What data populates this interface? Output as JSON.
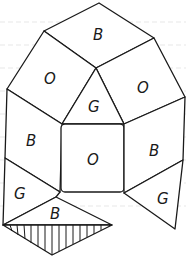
{
  "diagram": {
    "type": "polyhedron-net-coloring",
    "stroke_color": "#1a1a1a",
    "faces": [
      {
        "id": "top",
        "label": "B",
        "x": 99,
        "y": 34
      },
      {
        "id": "upper-left",
        "label": "O",
        "x": 50,
        "y": 78
      },
      {
        "id": "upper-right",
        "label": "O",
        "x": 143,
        "y": 87
      },
      {
        "id": "center-triangle",
        "label": "G",
        "x": 94,
        "y": 106
      },
      {
        "id": "left",
        "label": "B",
        "x": 32,
        "y": 140
      },
      {
        "id": "center-square",
        "label": "O",
        "x": 93,
        "y": 159
      },
      {
        "id": "right",
        "label": "B",
        "x": 155,
        "y": 150
      },
      {
        "id": "lower-left",
        "label": "G",
        "x": 20,
        "y": 193
      },
      {
        "id": "bottom-triangle",
        "label": "B",
        "x": 56,
        "y": 213
      },
      {
        "id": "lower-right",
        "label": "G",
        "x": 163,
        "y": 198
      },
      {
        "id": "hatched-triangle",
        "label": "",
        "hatched": true
      }
    ]
  }
}
